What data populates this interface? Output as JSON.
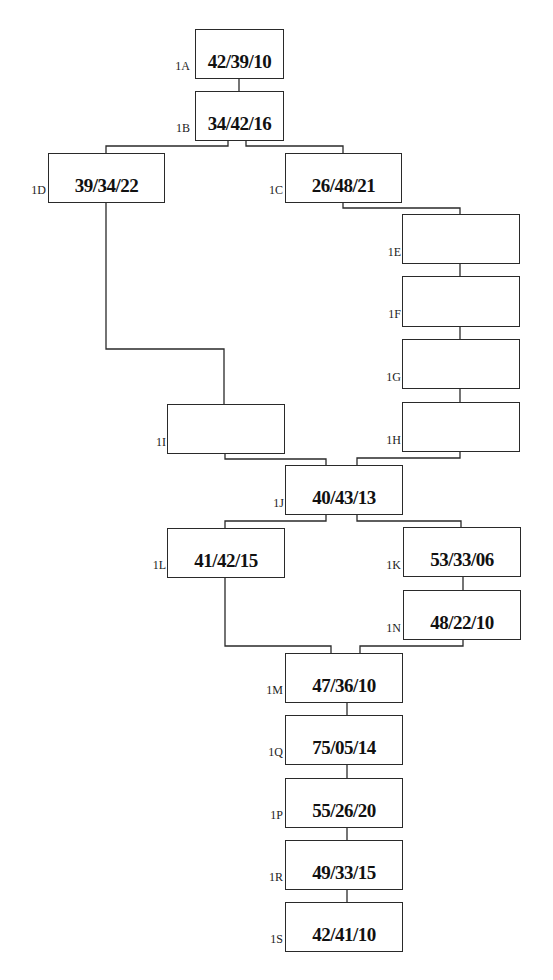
{
  "diagram": {
    "type": "flowchart",
    "line_color": "#2a2a2a",
    "background": "#ffffff",
    "nodes": {
      "1A": {
        "label": "1A",
        "value": "42/39/10"
      },
      "1B": {
        "label": "1B",
        "value": "34/42/16"
      },
      "1D": {
        "label": "1D",
        "value": "39/34/22"
      },
      "1C": {
        "label": "1C",
        "value": "26/48/21"
      },
      "1E": {
        "label": "1E",
        "value": ""
      },
      "1F": {
        "label": "1F",
        "value": ""
      },
      "1G": {
        "label": "1G",
        "value": ""
      },
      "1H": {
        "label": "1H",
        "value": ""
      },
      "1I": {
        "label": "1I",
        "value": ""
      },
      "1J": {
        "label": "1J",
        "value": "40/43/13"
      },
      "1L": {
        "label": "1L",
        "value": "41/42/15"
      },
      "1K": {
        "label": "1K",
        "value": "53/33/06"
      },
      "1N": {
        "label": "1N",
        "value": "48/22/10"
      },
      "1M": {
        "label": "1M",
        "value": "47/36/10"
      },
      "1Q": {
        "label": "1Q",
        "value": "75/05/14"
      },
      "1P": {
        "label": "1P",
        "value": "55/26/20"
      },
      "1R": {
        "label": "1R",
        "value": "49/33/15"
      },
      "1S": {
        "label": "1S",
        "value": "42/41/10"
      }
    },
    "edges": [
      [
        "1A",
        "1B"
      ],
      [
        "1B",
        "1D"
      ],
      [
        "1B",
        "1C"
      ],
      [
        "1C",
        "1E"
      ],
      [
        "1E",
        "1F"
      ],
      [
        "1F",
        "1G"
      ],
      [
        "1G",
        "1H"
      ],
      [
        "1D",
        "1I"
      ],
      [
        "1I",
        "1J"
      ],
      [
        "1H",
        "1J"
      ],
      [
        "1J",
        "1L"
      ],
      [
        "1J",
        "1K"
      ],
      [
        "1K",
        "1N"
      ],
      [
        "1L",
        "1M"
      ],
      [
        "1N",
        "1M"
      ],
      [
        "1M",
        "1Q"
      ],
      [
        "1Q",
        "1P"
      ],
      [
        "1P",
        "1R"
      ],
      [
        "1R",
        "1S"
      ]
    ]
  }
}
